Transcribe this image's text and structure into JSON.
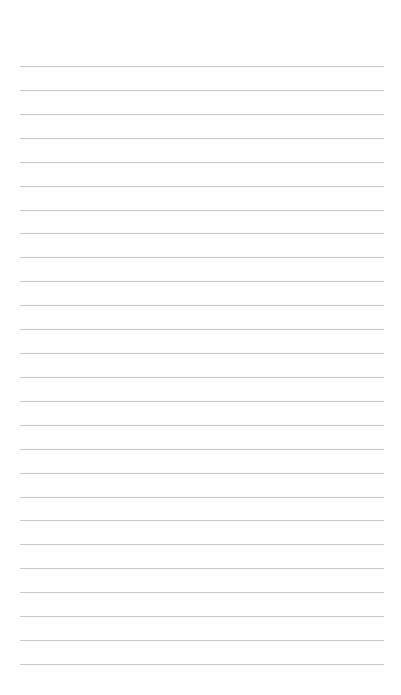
{
  "page": {
    "type": "lined-paper",
    "background_color": "#fefefe",
    "rule_color": "#c9c9c9",
    "rule_count": 26,
    "first_rule_y": 66,
    "rule_spacing": 23.92,
    "rule_left": 20,
    "rule_width": 364,
    "text": []
  }
}
